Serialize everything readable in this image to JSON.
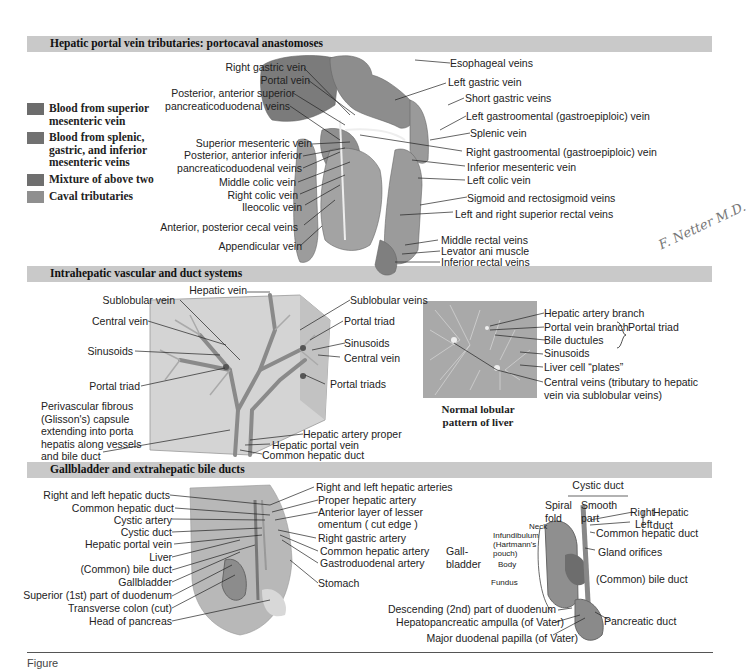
{
  "sections": [
    {
      "title": "Hepatic portal vein tributaries: portocaval anastomoses"
    },
    {
      "title": "Intrahepatic vascular and duct systems"
    },
    {
      "title": "Gallbladder and extrahepatic bile ducts"
    }
  ],
  "legend": [
    {
      "label": "Blood from superior mesenteric vein",
      "color": "#6c6c6c"
    },
    {
      "label": "Blood from splenic, gastric, and inferior mesenteric veins",
      "color": "#717171"
    },
    {
      "label": "Mixture of above two",
      "color": "#6f6f6f"
    },
    {
      "label": "Caval tributaries",
      "color": "#8f8f8f"
    }
  ],
  "portal": {
    "left_labels": [
      "Right gastric vein",
      "Portal vein",
      "Posterior, anterior superior",
      "pancreaticoduodenal veins",
      "Superior mesenteric vein",
      "Posterior, anterior inferior",
      "pancreaticoduodenal veins",
      "Middle colic vein",
      "Right colic vein",
      "Ileocolic vein",
      "Anterior, posterior cecal veins",
      "Appendicular vein"
    ],
    "right_labels": [
      "Esophageal veins",
      "Left gastric vein",
      "Short gastric veins",
      "Left gastroomental (gastroepiploic) vein",
      "Splenic vein",
      "Right gastroomental (gastroepiploic) vein",
      "Inferior mesenteric vein",
      "Left colic vein",
      "Sigmoid and rectosigmoid veins",
      "Left and right superior rectal veins",
      "Middle rectal veins",
      "Levator ani muscle",
      "Inferior rectal veins"
    ],
    "signature": "F. Netter M.D."
  },
  "intrahepatic": {
    "left_labels": [
      "Hepatic vein",
      "Sublobular vein",
      "Central vein",
      "Sinusoids",
      "Portal triad"
    ],
    "capsule_label": [
      "Perivascular fibrous",
      "(Glisson's) capsule",
      "extending into porta",
      "hepatis along vessels",
      "and bile duct"
    ],
    "right_labels": [
      "Sublobular veins",
      "Portal triad",
      "Sinusoids",
      "Central vein",
      "Portal triads",
      "Hepatic artery proper",
      "Hepatic portal vein",
      "Common hepatic duct"
    ],
    "lobular": {
      "caption": [
        "Normal lobular",
        "pattern of liver"
      ],
      "labels": [
        "Hepatic artery branch",
        "Portal vein branch",
        "Bile ductules",
        "Sinusoids",
        "Liver cell “plates”",
        "Central veins (tributary to hepatic",
        "vein via sublobular veins)"
      ],
      "group_label": "Portal triad"
    }
  },
  "gallbladder": {
    "left_labels": [
      "Right and left hepatic ducts",
      "Common hepatic duct",
      "Cystic artery",
      "Cystic duct",
      "Hepatic portal vein",
      "Liver",
      "(Common) bile duct",
      "Gallbladder",
      "Superior (1st) part of duodenum",
      "Transverse colon (cut)",
      "Head of pancreas"
    ],
    "right_labels": [
      "Right and left hepatic arteries",
      "Proper hepatic artery",
      "Anterior layer of lesser",
      "omentum ( cut edge )",
      "Right gastric artery",
      "Common hepatic artery",
      "Gastroduodenal artery",
      "Stomach"
    ],
    "detail": {
      "cystic_duct": "Cystic duct",
      "spiral": [
        "Spiral",
        "fold"
      ],
      "smooth": [
        "Smooth",
        "part"
      ],
      "right": "Right",
      "left": "Left",
      "hepatic_duct": [
        "Hepatic",
        "duct"
      ],
      "common_hepatic": "Common hepatic duct",
      "gland": "Gland orifices",
      "common_bile": "(Common) bile duct",
      "gall": [
        "Gall-",
        "bladder"
      ],
      "neck": "Neck",
      "infundibulum": [
        "Infundibulum",
        "(Hartmann's",
        "pouch)"
      ],
      "body": "Body",
      "fundus": "Fundus",
      "pancreatic": "Pancreatic duct",
      "bottom_labels": [
        "Descending (2nd) part of duodenum",
        "Hepatopancreatic ampulla (of Vater)",
        "Major duodenal papilla (of Vater)"
      ]
    }
  },
  "caption": "Figure"
}
